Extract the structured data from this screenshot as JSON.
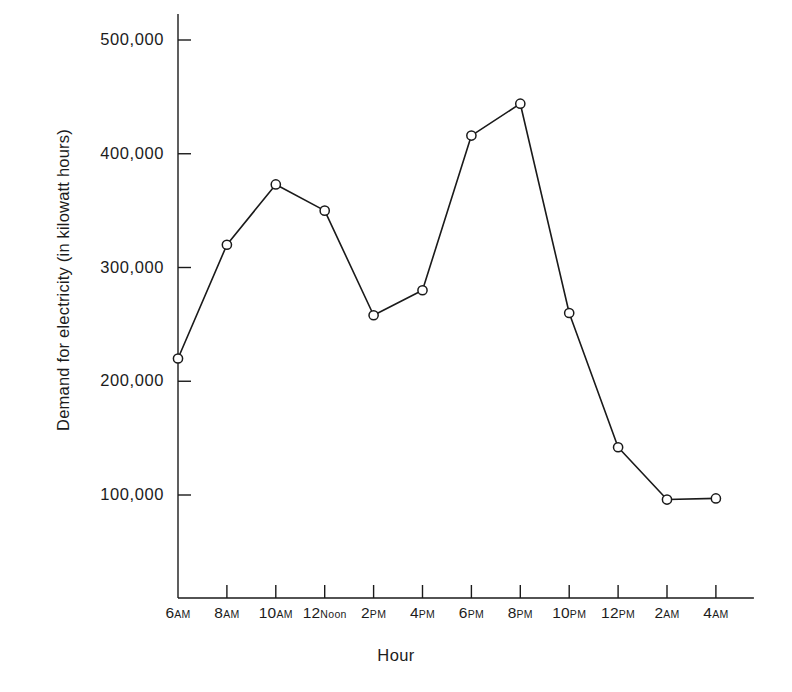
{
  "chart_data": {
    "type": "line",
    "title": "",
    "xlabel": "Hour",
    "ylabel": "Demand for electricity (in kilowatt hours)",
    "categories": [
      "6AM",
      "8AM",
      "10AM",
      "12Noon",
      "2PM",
      "4PM",
      "6PM",
      "8PM",
      "10PM",
      "12PM",
      "2AM",
      "4AM"
    ],
    "category_parts": [
      {
        "num": "6",
        "suffix": "AM"
      },
      {
        "num": "8",
        "suffix": "AM"
      },
      {
        "num": "10",
        "suffix": "AM"
      },
      {
        "num": "12",
        "suffix": "Noon"
      },
      {
        "num": "2",
        "suffix": "PM"
      },
      {
        "num": "4",
        "suffix": "PM"
      },
      {
        "num": "6",
        "suffix": "PM"
      },
      {
        "num": "8",
        "suffix": "PM"
      },
      {
        "num": "10",
        "suffix": "PM"
      },
      {
        "num": "12",
        "suffix": "PM"
      },
      {
        "num": "2",
        "suffix": "AM"
      },
      {
        "num": "4",
        "suffix": "AM"
      }
    ],
    "values": [
      220000,
      320000,
      373000,
      350000,
      258000,
      280000,
      416000,
      444000,
      260000,
      142000,
      96000,
      97000
    ],
    "ylim": [
      0,
      500000
    ],
    "ytick_values": [
      100000,
      200000,
      300000,
      400000,
      500000
    ],
    "ytick_labels": [
      "100,000",
      "200,000",
      "300,000",
      "400,000",
      "500,000"
    ],
    "grid": false,
    "legend": "none",
    "marker": "open-circle",
    "line_color": "#1a1a1a",
    "marker_fill": "#ffffff"
  }
}
